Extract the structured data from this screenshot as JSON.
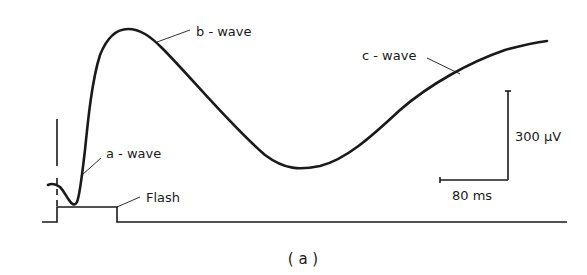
{
  "figure": {
    "caption": "( a )",
    "labels": {
      "a_wave": "a - wave",
      "b_wave": "b - wave",
      "c_wave": "c - wave",
      "flash": "Flash",
      "scale_voltage": "300 μV",
      "scale_time": "80 ms"
    },
    "colors": {
      "trace": "#1a1a1a",
      "background": "#ffffff"
    }
  }
}
